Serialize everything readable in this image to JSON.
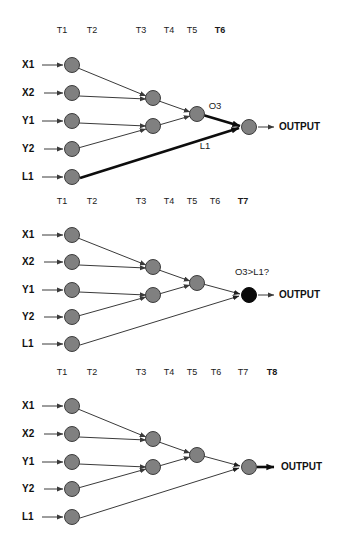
{
  "figure": {
    "node_color": "#808080",
    "node_active_color": "#0a0a0a",
    "edge_color": "#3a3a3a",
    "edge_highlight_color": "#0d0d0d"
  },
  "labels": {
    "inputs": [
      "X1",
      "X2",
      "Y1",
      "Y2",
      "L1"
    ],
    "output": "OUTPUT"
  },
  "panels": [
    {
      "id": "panel-t6",
      "timeline": [
        "T1",
        "T2",
        "T3",
        "T4",
        "T5",
        "T6"
      ],
      "current_step": "T6",
      "annotations": [
        {
          "name": "o3-label",
          "text": "O3"
        },
        {
          "name": "l1-edge-label",
          "text": "L1"
        }
      ],
      "output_node_state": "inactive",
      "highlighted_edges": [
        "L1-to-output",
        "O3-to-output"
      ]
    },
    {
      "id": "panel-t7",
      "timeline": [
        "T1",
        "T2",
        "T3",
        "T4",
        "T5",
        "T6",
        "T7"
      ],
      "current_step": "T7",
      "annotations": [
        {
          "name": "comparison-label",
          "text": "O3>L1?"
        }
      ],
      "output_node_state": "active",
      "highlighted_edges": []
    },
    {
      "id": "panel-t8",
      "timeline": [
        "T1",
        "T2",
        "T3",
        "T4",
        "T5",
        "T6",
        "T7",
        "T8"
      ],
      "current_step": "T8",
      "annotations": [],
      "output_node_state": "inactive",
      "highlighted_edges": [
        "output-arrow"
      ]
    }
  ],
  "ghost_text": {
    "row1": "",
    "row2": ""
  }
}
